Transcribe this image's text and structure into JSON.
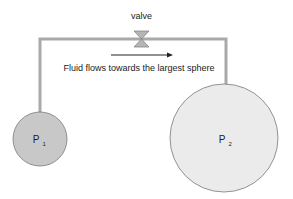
{
  "diagram": {
    "valve_label": "valve",
    "flow_caption": "Fluid flows towards the largest sphere",
    "spheres": [
      {
        "id": "P1",
        "label": "P",
        "subscript": "1",
        "fill": "#c8c8c8"
      },
      {
        "id": "P2",
        "label": "P",
        "subscript": "2",
        "fill": "#ebebeb"
      }
    ],
    "colors": {
      "pipe": "#a9a9a9",
      "valve": "#b5b5b5",
      "outline": "#7a7a7a",
      "arrow": "#222222"
    }
  }
}
